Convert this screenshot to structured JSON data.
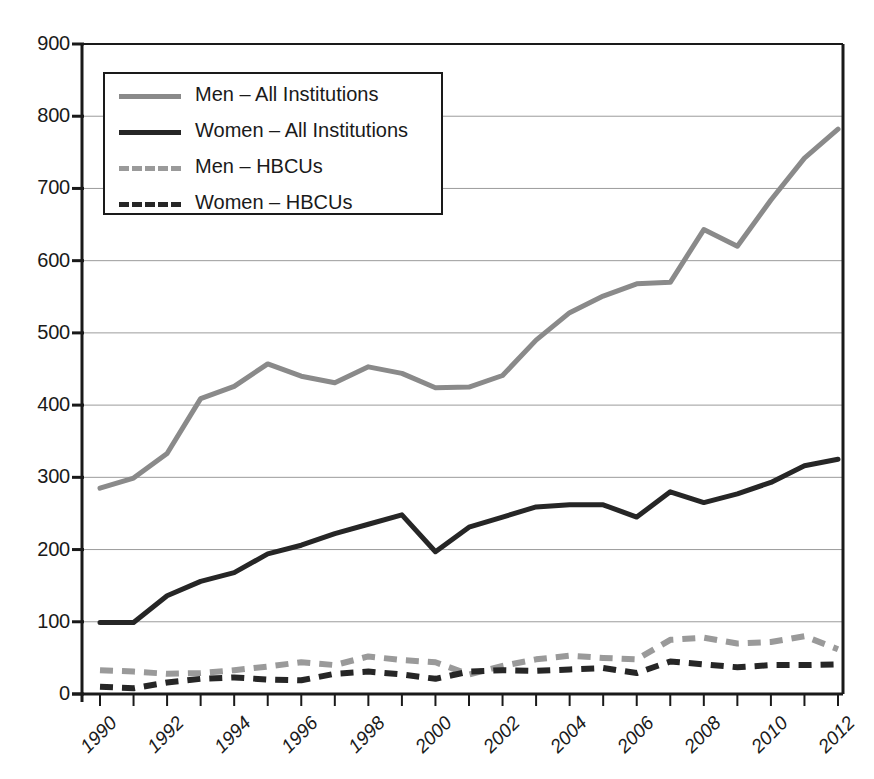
{
  "chart_data": {
    "type": "line",
    "title": "",
    "xlabel": "",
    "ylabel": "",
    "xlim": [
      1990,
      2012
    ],
    "ylim": [
      0,
      900
    ],
    "ytick_labels": [
      "0",
      "100",
      "200",
      "300",
      "400",
      "500",
      "600",
      "700",
      "800",
      "900"
    ],
    "yticks": [
      0,
      100,
      200,
      300,
      400,
      500,
      600,
      700,
      800,
      900
    ],
    "xtick_labels": [
      "1990",
      "1992",
      "1994",
      "1996",
      "1998",
      "2000",
      "2002",
      "2004",
      "2006",
      "2008",
      "2010",
      "2012"
    ],
    "xticks": [
      1990,
      1992,
      1994,
      1996,
      1998,
      2000,
      2002,
      2004,
      2006,
      2008,
      2010,
      2012
    ],
    "x": [
      1990,
      1991,
      1992,
      1993,
      1994,
      1995,
      1996,
      1997,
      1998,
      1999,
      2000,
      2001,
      2002,
      2003,
      2004,
      2005,
      2006,
      2007,
      2008,
      2009,
      2010,
      2011,
      2012
    ],
    "grid": "horizontal",
    "legend_position": "upper-left",
    "series": [
      {
        "name": "Men – All Institutions",
        "color": "#8a8a8a",
        "style": "solid",
        "values": [
          285,
          299,
          333,
          409,
          426,
          457,
          440,
          431,
          453,
          444,
          424,
          425,
          441,
          490,
          528,
          551,
          568,
          570,
          643,
          620,
          684,
          742,
          782
        ]
      },
      {
        "name": "Women – All Institutions",
        "color": "#262626",
        "style": "solid",
        "values": [
          99,
          99,
          136,
          156,
          168,
          194,
          206,
          222,
          235,
          248,
          197,
          231,
          245,
          259,
          262,
          262,
          245,
          280,
          265,
          277,
          293,
          316,
          325
        ]
      },
      {
        "name": "Men – HBCUs",
        "color": "#9a9a9a",
        "style": "dashed",
        "values": [
          33,
          31,
          28,
          29,
          33,
          38,
          44,
          40,
          52,
          47,
          44,
          27,
          39,
          48,
          53,
          50,
          48,
          75,
          78,
          70,
          72,
          80,
          62
        ]
      },
      {
        "name": "Women – HBCUs",
        "color": "#262626",
        "style": "dashed",
        "values": [
          10,
          8,
          16,
          21,
          23,
          20,
          19,
          28,
          31,
          27,
          21,
          31,
          33,
          32,
          34,
          36,
          29,
          45,
          41,
          37,
          40,
          40,
          41
        ]
      }
    ]
  },
  "legend": {
    "items": [
      {
        "label": "Men – All Institutions",
        "swatch": "sw-solid-gray"
      },
      {
        "label": "Women – All Institutions",
        "swatch": "sw-solid-black"
      },
      {
        "label": "Men – HBCUs",
        "swatch": "sw-dash-gray"
      },
      {
        "label": "Women – HBCUs",
        "swatch": "sw-dash-black"
      }
    ]
  }
}
